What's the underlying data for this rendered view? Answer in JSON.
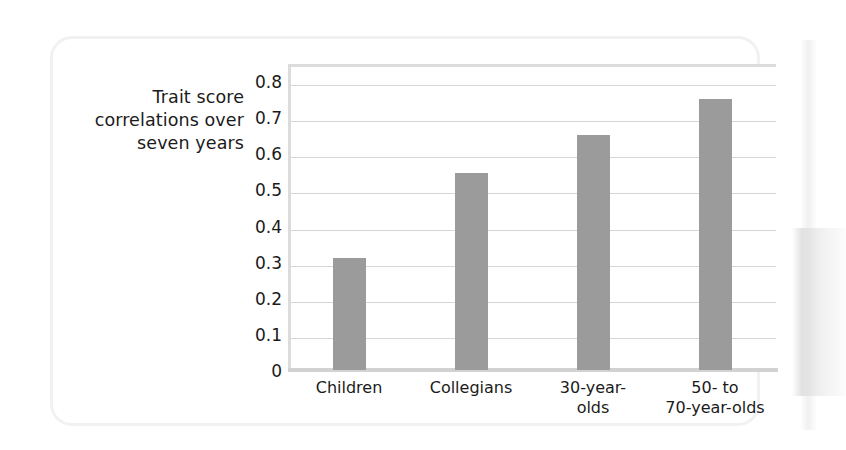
{
  "chart_data": {
    "type": "bar",
    "title": "",
    "subtitle": "",
    "xlabel": "",
    "ylabel": "Trait score correlations over seven years",
    "ylabel_lines": [
      "Trait score",
      "correlations over",
      "seven years"
    ],
    "categories": [
      "Children",
      "Collegians",
      "30-year-olds",
      "50- to 70-year-olds"
    ],
    "category_lines": [
      [
        "Children"
      ],
      [
        "Collegians"
      ],
      [
        "30-year-",
        "olds"
      ],
      [
        "50-  to",
        "70-year-olds"
      ]
    ],
    "values": [
      0.31,
      0.545,
      0.65,
      0.75
    ],
    "ylim": [
      0,
      0.85
    ],
    "yticks": [
      0,
      0.1,
      0.2,
      0.3,
      0.4,
      0.5,
      0.6,
      0.7,
      0.8
    ],
    "ytick_labels": [
      "0",
      "0.1",
      "0.2",
      "0.3",
      "0.4",
      "0.5",
      "0.6",
      "0.7",
      "0.8"
    ],
    "grid": true,
    "legend": false,
    "legend_position": "none",
    "bar_color": "#9b9b9b",
    "gridline_color": "#d6d6d6",
    "axis_color": "#dcdcdc",
    "text_color": "#1b1b1b",
    "background_color": "#ffffff"
  }
}
